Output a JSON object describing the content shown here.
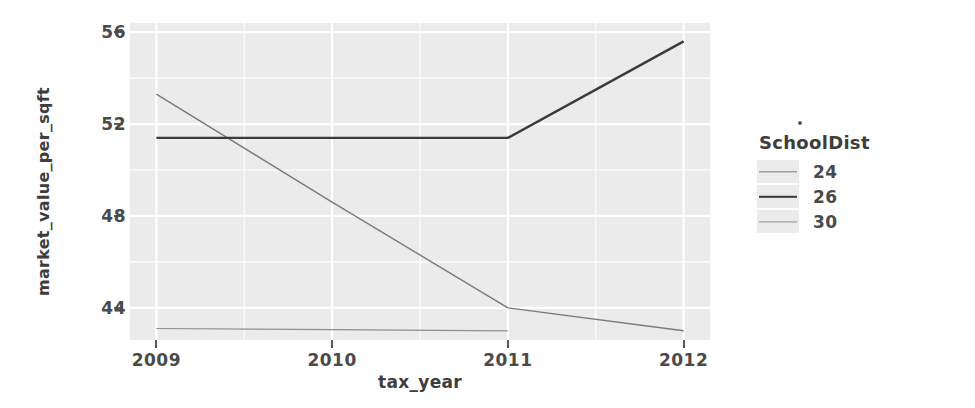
{
  "chart_data": {
    "type": "line",
    "title": "",
    "xlabel": "tax_year",
    "ylabel": "market_value_per_sqft",
    "x": [
      2009,
      2010,
      2011,
      2012
    ],
    "xlim": [
      2008.85,
      2012.15
    ],
    "ylim": [
      42.6,
      56.4
    ],
    "xticks": [
      "2009",
      "2010",
      "2011",
      "2012"
    ],
    "yticks": [
      "56",
      "52",
      "48",
      "44"
    ],
    "ytick_values": [
      56,
      52,
      48,
      44
    ],
    "grid": true,
    "legend_position": "right",
    "legend_title": "SchoolDist",
    "series": [
      {
        "name": "24",
        "color": "#7a7a7a",
        "width": 1.4,
        "x": [
          2009,
          2010,
          2011,
          2012
        ],
        "values": [
          53.3,
          48.6,
          44.0,
          43.0
        ]
      },
      {
        "name": "26",
        "color": "#3a3a3a",
        "width": 2.4,
        "x": [
          2009,
          2010,
          2011,
          2012
        ],
        "values": [
          51.4,
          51.4,
          51.4,
          55.6
        ]
      },
      {
        "name": "30",
        "color": "#8f8f8f",
        "width": 1.2,
        "x": [
          2009,
          2010,
          2011
        ],
        "values": [
          43.1,
          43.05,
          43.0
        ]
      }
    ]
  },
  "axes": {
    "y_title": "market_value_per_sqft",
    "x_title": "tax_year",
    "y_tick_labels": [
      "56",
      "52",
      "48",
      "44"
    ],
    "x_tick_labels": [
      "2009",
      "2010",
      "2011",
      "2012"
    ]
  },
  "legend": {
    "title": "SchoolDist",
    "items": [
      {
        "label": "24",
        "color": "#7a7a7a",
        "width": 1.4
      },
      {
        "label": "26",
        "color": "#3a3a3a",
        "width": 2.4
      },
      {
        "label": "30",
        "color": "#8f8f8f",
        "width": 1.2
      }
    ]
  },
  "colors": {
    "panel_background": "#ebebeb",
    "gridline": "#ffffff",
    "page_background": "#ffffff",
    "text": "#4a4a4a"
  }
}
